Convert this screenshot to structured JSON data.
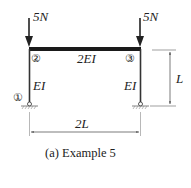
{
  "diagram": {
    "type": "portal-frame",
    "loads": [
      {
        "label": "5N",
        "node": "2",
        "direction": "down"
      },
      {
        "label": "5N",
        "node": "3",
        "direction": "down"
      }
    ],
    "nodes": [
      {
        "id": "1",
        "label": "①",
        "support": "pin"
      },
      {
        "id": "2",
        "label": "②"
      },
      {
        "id": "3",
        "label": "③"
      },
      {
        "id": "4",
        "support": "pin"
      }
    ],
    "members": {
      "beam": {
        "stiffness": "2EI"
      },
      "left_column": {
        "stiffness": "EI"
      },
      "right_column": {
        "stiffness": "EI"
      }
    },
    "dimensions": {
      "height": "L",
      "span": "2L"
    },
    "caption": "(a) Example 5"
  },
  "colors": {
    "line": "#222222",
    "dim_line": "#555555",
    "background": "#ffffff"
  }
}
